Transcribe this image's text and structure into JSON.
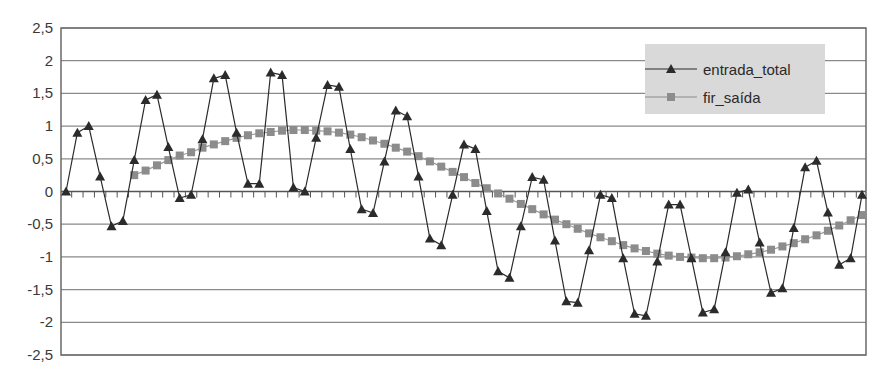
{
  "chart_data": {
    "type": "line",
    "title": "",
    "xlabel": "",
    "ylabel": "",
    "ylim": [
      -2.5,
      2.5
    ],
    "yticks": [
      2.5,
      2,
      1.5,
      1,
      0.5,
      0,
      -0.5,
      -1,
      -1.5,
      -2,
      -2.5
    ],
    "ytick_labels": [
      "2,5",
      "2",
      "1,5",
      "1",
      "0,5",
      "0",
      "-0,5",
      "-1",
      "-1,5",
      "-2",
      "-2,5"
    ],
    "grid": true,
    "legend_position": "upper right",
    "series": [
      {
        "name": "entrada_total",
        "marker": "triangle",
        "color": "#2b2b2b",
        "start_index": 0,
        "values": [
          0,
          0.9,
          1.0,
          0.23,
          -0.53,
          -0.45,
          0.48,
          1.4,
          1.48,
          0.68,
          -0.1,
          -0.05,
          0.8,
          1.73,
          1.78,
          0.9,
          0.12,
          0.12,
          1.82,
          1.78,
          0.06,
          0.0,
          0.82,
          1.63,
          1.6,
          0.65,
          -0.27,
          -0.33,
          0.46,
          1.24,
          1.15,
          0.23,
          -0.72,
          -0.82,
          -0.05,
          0.72,
          0.65,
          -0.3,
          -1.22,
          -1.32,
          -0.53,
          0.22,
          0.18,
          -0.75,
          -1.68,
          -1.7,
          -0.9,
          -0.05,
          -0.1,
          -1.02,
          -1.87,
          -1.9,
          -1.07,
          -0.2,
          -0.2,
          -1.02,
          -1.85,
          -1.8,
          -0.93,
          -0.02,
          0.03,
          -0.78,
          -1.55,
          -1.48,
          -0.56,
          0.37,
          0.47,
          -0.32,
          -1.12,
          -1.02,
          -0.05
        ]
      },
      {
        "name": "fir_saída",
        "marker": "square",
        "color": "#8c8c8c",
        "start_index": 6,
        "values": [
          0.25,
          0.32,
          0.4,
          0.48,
          0.55,
          0.6,
          0.67,
          0.72,
          0.77,
          0.82,
          0.86,
          0.89,
          0.91,
          0.93,
          0.94,
          0.94,
          0.93,
          0.92,
          0.9,
          0.87,
          0.83,
          0.78,
          0.73,
          0.67,
          0.61,
          0.54,
          0.46,
          0.38,
          0.3,
          0.22,
          0.13,
          0.05,
          -0.03,
          -0.11,
          -0.19,
          -0.27,
          -0.35,
          -0.43,
          -0.5,
          -0.57,
          -0.64,
          -0.7,
          -0.76,
          -0.82,
          -0.87,
          -0.91,
          -0.95,
          -0.98,
          -1.0,
          -1.01,
          -1.02,
          -1.02,
          -1.01,
          -0.99,
          -0.96,
          -0.93,
          -0.89,
          -0.84,
          -0.79,
          -0.73,
          -0.67,
          -0.6,
          -0.52,
          -0.44,
          -0.36
        ]
      }
    ],
    "n_points": 71
  },
  "legend": {
    "items": [
      {
        "label": "entrada_total"
      },
      {
        "label": "fir_saída"
      }
    ]
  },
  "colors": {
    "line_entrada": "#2b2b2b",
    "marker_fir": "#8c8c8c",
    "grid": "#8a8a8a",
    "axis": "#555555",
    "legend_bg": "#d9d9d9"
  }
}
